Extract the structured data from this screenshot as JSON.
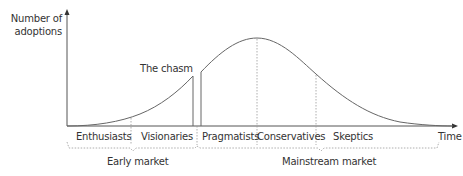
{
  "diagram": {
    "type": "technology-adoption-lifecycle",
    "y_axis_label_line1": "Number of",
    "y_axis_label_line2": "adoptions",
    "x_axis_label": "Time",
    "chasm_label": "The chasm",
    "segments": [
      {
        "label": "Enthusiasts"
      },
      {
        "label": "Visionaries"
      },
      {
        "label": "Pragmatists"
      },
      {
        "label": "Conservatives"
      },
      {
        "label": "Skeptics"
      }
    ],
    "markets": [
      {
        "label": "Early market"
      },
      {
        "label": "Mainstream market"
      }
    ],
    "colors": {
      "line": "#555555",
      "dotted": "#888888",
      "text": "#333333"
    }
  }
}
